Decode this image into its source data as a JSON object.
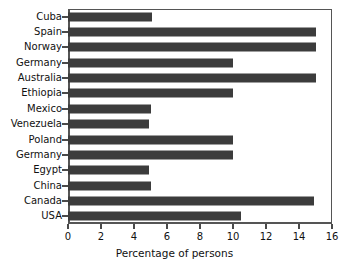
{
  "chart_data": {
    "type": "bar",
    "orientation": "horizontal",
    "title": "",
    "subtitle": "",
    "xlabel": "Percentage of persons",
    "ylabel": "",
    "categories": [
      "Cuba",
      "Spain",
      "Norway",
      "Germany",
      "Australia",
      "Ethiopia",
      "Mexico",
      "Venezuela",
      "Poland",
      "Germany",
      "Egypt",
      "China",
      "Canada",
      "USA"
    ],
    "values": [
      5.1,
      15.0,
      15.0,
      10.0,
      15.0,
      10.0,
      5.0,
      4.9,
      10.0,
      10.0,
      4.9,
      5.0,
      14.9,
      10.5
    ],
    "xlim": [
      0,
      16
    ],
    "xticks": [
      0,
      2,
      4,
      6,
      8,
      10,
      12,
      14,
      16
    ],
    "xtick_labels": [
      "0",
      "2",
      "4",
      "6",
      "8",
      "10",
      "12",
      "14",
      "16"
    ],
    "grid": false,
    "legend": false,
    "legend_position": "none",
    "bar_color": "#3c3c3c",
    "background_color": "#ffffff",
    "axis_color": "#555555"
  }
}
